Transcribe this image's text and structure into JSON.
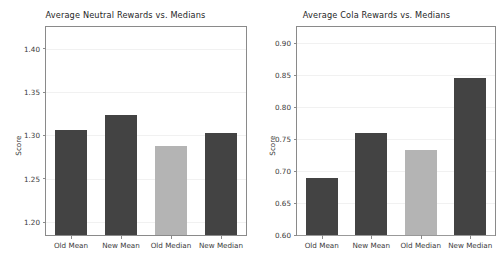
{
  "figure": {
    "background_color": "#ffffff",
    "width": 502,
    "height": 265,
    "panel_count": 2
  },
  "colors": {
    "bar_dark": "#434343",
    "bar_light": "#b4b4b4",
    "axis": "#8a8a8a",
    "text": "#3a3a3a",
    "title": "#262626"
  },
  "chart_data": [
    {
      "type": "bar",
      "title": "Average Neutral Rewards vs. Medians",
      "xlabel": "",
      "ylabel": "Score",
      "categories": [
        "Old Mean",
        "New Mean",
        "Old Median",
        "New Median"
      ],
      "values": [
        1.306,
        1.323,
        1.288,
        1.303
      ],
      "bar_colors": [
        "#434343",
        "#434343",
        "#b4b4b4",
        "#434343"
      ],
      "ylim": [
        1.185,
        1.425
      ],
      "yticks": [
        1.2,
        1.25,
        1.3,
        1.35,
        1.4
      ],
      "ytick_labels": [
        "1.20",
        "1.25",
        "1.30",
        "1.35",
        "1.40"
      ],
      "grid": false,
      "legend": null
    },
    {
      "type": "bar",
      "title": "Average Cola Rewards vs. Medians",
      "xlabel": "",
      "ylabel": "Score",
      "categories": [
        "Old Mean",
        "New Mean",
        "Old Median",
        "New Median"
      ],
      "values": [
        0.689,
        0.759,
        0.733,
        0.845
      ],
      "bar_colors": [
        "#434343",
        "#434343",
        "#b4b4b4",
        "#434343"
      ],
      "ylim": [
        0.6,
        0.925
      ],
      "yticks": [
        0.6,
        0.65,
        0.7,
        0.75,
        0.8,
        0.85,
        0.9
      ],
      "ytick_labels": [
        "0.60",
        "0.65",
        "0.70",
        "0.75",
        "0.80",
        "0.85",
        "0.90"
      ],
      "grid": false,
      "legend": null
    }
  ]
}
